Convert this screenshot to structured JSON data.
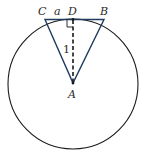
{
  "diagram": {
    "type": "geometry",
    "points": {
      "A": {
        "label": "A"
      },
      "B": {
        "label": "B"
      },
      "C": {
        "label": "C"
      },
      "D": {
        "label": "D"
      }
    },
    "segment_labels": {
      "CD": "a",
      "AD": "1"
    },
    "elements": [
      {
        "kind": "circle",
        "center": "A"
      },
      {
        "kind": "triangle",
        "vertices": [
          "A",
          "B",
          "C"
        ],
        "stroke": "#1f3a5f"
      },
      {
        "kind": "dashed-segment",
        "from": "D",
        "to": "A"
      },
      {
        "kind": "right-angle-marker",
        "at": "D"
      },
      {
        "kind": "tangent-line",
        "segment": "CB",
        "touches_at": "D"
      }
    ],
    "colors": {
      "circle": "#1a1a1a",
      "triangle": "#1f3a5f",
      "dashed": "#1a1a1a"
    }
  }
}
